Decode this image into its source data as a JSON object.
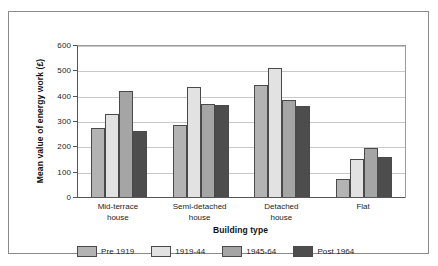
{
  "chart_data": {
    "type": "bar",
    "title": "",
    "xlabel": "Building type",
    "ylabel": "Mean value of energy work (£)",
    "categories": [
      "Mid-terrace\nhouse",
      "Semi-detached\nhouse",
      "Detached\nhouse",
      "Flat"
    ],
    "series": [
      {
        "name": "Pre 1919",
        "color": "#b3b3b3",
        "values": [
          275,
          288,
          445,
          76
        ]
      },
      {
        "name": "1919-44",
        "color": "#e2e2e2",
        "values": [
          330,
          440,
          515,
          153
        ]
      },
      {
        "name": "1945-64",
        "color": "#a5a5a5",
        "values": [
          423,
          372,
          385,
          198
        ]
      },
      {
        "name": "Post 1964",
        "color": "#4d4d4d",
        "values": [
          266,
          368,
          365,
          161
        ]
      }
    ],
    "ylim": [
      0,
      600
    ],
    "yticks": [
      0,
      100,
      200,
      300,
      400,
      500,
      600
    ],
    "ytick_labels": [
      "0",
      "100",
      "200",
      "300",
      "400",
      "500",
      "600"
    ],
    "grid": true,
    "legend_position": "bottom"
  },
  "legend": {
    "items": [
      {
        "label": "Pre 1919"
      },
      {
        "label": "1919-44"
      },
      {
        "label": "1945-64"
      },
      {
        "label": "Post 1964"
      }
    ]
  },
  "axes": {
    "x_title": "Building type",
    "y_title": "Mean value of energy work (£)",
    "x_categories": [
      "Mid-terrace\nhouse",
      "Semi-detached\nhouse",
      "Detached\nhouse",
      "Flat"
    ],
    "y_tick_labels": [
      "0",
      "100",
      "200",
      "300",
      "400",
      "500",
      "600"
    ]
  },
  "colors": {
    "series_1": "#b3b3b3",
    "series_2": "#e2e2e2",
    "series_3": "#a5a5a5",
    "series_4": "#4d4d4d",
    "frame": "#8a8a8a",
    "axis": "#55565a",
    "grid": "#c9c9c9",
    "background": "#ffffff"
  }
}
